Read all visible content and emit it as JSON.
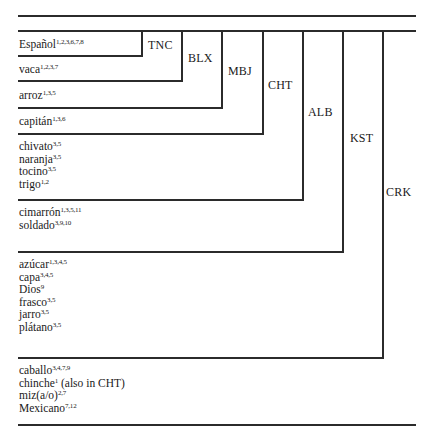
{
  "diagram": {
    "type": "nested-implicational-table",
    "languages": [
      {
        "code": "TNC",
        "x": 141,
        "bottom": 55,
        "label_x": 148,
        "label_y": 39
      },
      {
        "code": "BLX",
        "x": 181,
        "bottom": 80,
        "label_x": 188,
        "label_y": 52
      },
      {
        "code": "MBJ",
        "x": 221,
        "bottom": 107,
        "label_x": 228,
        "label_y": 65
      },
      {
        "code": "CHT",
        "x": 262,
        "bottom": 133,
        "label_x": 268,
        "label_y": 79
      },
      {
        "code": "ALB",
        "x": 302,
        "bottom": 199,
        "label_x": 308,
        "label_y": 106
      },
      {
        "code": "KST",
        "x": 342,
        "bottom": 251,
        "label_x": 350,
        "label_y": 132
      },
      {
        "code": "CRK",
        "x": 382,
        "bottom": 357,
        "label_x": 386,
        "label_y": 186
      }
    ],
    "groups": [
      {
        "top": 38,
        "words": [
          {
            "word": "Español",
            "sup": "1,2,3,6,7,8"
          }
        ]
      },
      {
        "top": 63,
        "words": [
          {
            "word": "vaca",
            "sup": "1,2,3,7"
          }
        ]
      },
      {
        "top": 89,
        "words": [
          {
            "word": "arroz",
            "sup": "1,3,5"
          }
        ]
      },
      {
        "top": 115,
        "words": [
          {
            "word": "capitán",
            "sup": "1,3,6"
          }
        ]
      },
      {
        "top": 140,
        "words": [
          {
            "word": "chivato",
            "sup": "3,5"
          },
          {
            "word": "naranja",
            "sup": "3,5"
          },
          {
            "word": "tocino",
            "sup": "3,5"
          },
          {
            "word": "trigo",
            "sup": "1,2"
          }
        ]
      },
      {
        "top": 206,
        "words": [
          {
            "word": "cimarrón",
            "sup": "1,3,5,11"
          },
          {
            "word": "soldado",
            "sup": "3,9,10"
          }
        ]
      },
      {
        "top": 258,
        "words": [
          {
            "word": "azúcar",
            "sup": "1,3,4,5"
          },
          {
            "word": "capa",
            "sup": "3,4,5"
          },
          {
            "word": "Dios",
            "sup": "9"
          },
          {
            "word": "frasco",
            "sup": "3,5"
          },
          {
            "word": "jarro",
            "sup": "3,5"
          },
          {
            "word": "plátano",
            "sup": "3,5"
          }
        ]
      },
      {
        "top": 364,
        "words": [
          {
            "word": "caballo",
            "sup": "3,4,7,9"
          },
          {
            "word": "chinche",
            "sup": "1",
            "note": " (also in CHT)"
          },
          {
            "word": "miz(a/o)",
            "sup": "2,7"
          },
          {
            "word": "Mexicano",
            "sup": "7,12"
          }
        ]
      }
    ],
    "row_separators_y": [
      55,
      80,
      107,
      133,
      199,
      251,
      357
    ],
    "rules": {
      "top_y": 15,
      "header_y": 30,
      "bottom_y": 424,
      "left_x": 18,
      "right_x": 416
    },
    "line_color": "#2b2b2b"
  }
}
